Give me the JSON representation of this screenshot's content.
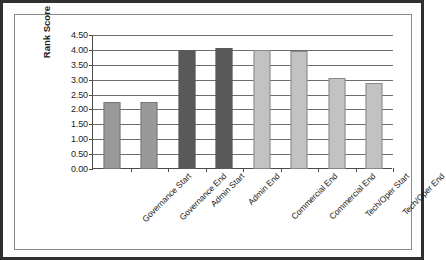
{
  "chart_data": {
    "type": "bar",
    "title": "",
    "xlabel": "",
    "ylabel": "Rank Score",
    "ylim": [
      0.0,
      4.5
    ],
    "ytick_step": 0.5,
    "grid": true,
    "legend": "none",
    "categories": [
      "Governance Start",
      "Governance End",
      "Admin Start",
      "Admin End",
      "Commercial End",
      "Commercial End",
      "Tech/Oper Start",
      "Tech/Oper End"
    ],
    "values": [
      2.25,
      2.25,
      4.0,
      4.05,
      4.0,
      3.97,
      3.05,
      2.9
    ],
    "bar_colors": [
      "#999999",
      "#999999",
      "#595959",
      "#595959",
      "#c2c2c2",
      "#c2c2c2",
      "#c2c2c2",
      "#c2c2c2"
    ],
    "ytick_labels": [
      "0.00",
      "0.50",
      "1.00",
      "1.50",
      "2.00",
      "2.50",
      "3.00",
      "3.50",
      "4.00",
      "4.50"
    ],
    "ytick_values": [
      0.0,
      0.5,
      1.0,
      1.5,
      2.0,
      2.5,
      3.0,
      3.5,
      4.0,
      4.5
    ]
  },
  "style": {
    "gridline_color": "#6e6e6e",
    "axis_color": "#4a4a4a",
    "text_color": "#1c1c1c",
    "plot_background": "#ffffff",
    "frame_border_color": "#8a8a8a",
    "page_border_color": "#2f2f2f"
  }
}
